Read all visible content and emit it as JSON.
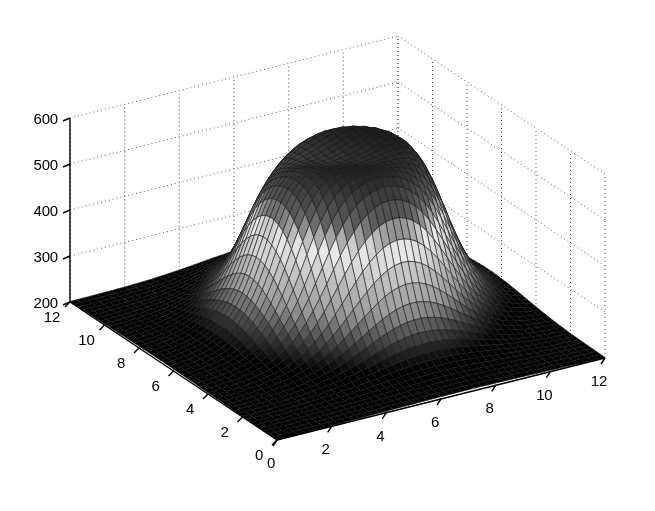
{
  "figure": {
    "width": 655,
    "height": 511,
    "background": "#ffffff",
    "title": "",
    "renderer": "surf-mesh-3d",
    "colormap": "gray"
  },
  "chart_data": {
    "type": "heatmap",
    "subtype": "surface-3d",
    "title": "",
    "xlabel": "",
    "ylabel": "",
    "zlabel": "",
    "grid": true,
    "legend": false,
    "colormap": "gray",
    "shading": "faceted",
    "mesh_line_color": "#1a1a1a",
    "xlim": [
      0,
      12
    ],
    "ylim": [
      0,
      12
    ],
    "zlim": [
      200,
      600
    ],
    "xticks": [
      0,
      2,
      4,
      6,
      8,
      10,
      12
    ],
    "yticks": [
      0,
      2,
      4,
      6,
      8,
      10,
      12
    ],
    "zticks": [
      200,
      300,
      400,
      500,
      600
    ],
    "xtick_labels": [
      "0",
      "2",
      "4",
      "6",
      "8",
      "10",
      "12"
    ],
    "ytick_labels": [
      "0",
      "2",
      "4",
      "6",
      "8",
      "10",
      "12"
    ],
    "ztick_labels": [
      "200",
      "300",
      "400",
      "500",
      "600"
    ],
    "view_azimuth": -37.5,
    "view_elevation": 30,
    "grid_lines": {
      "style": "dotted",
      "color": "#555555",
      "walls": [
        "back-left",
        "back-right",
        "floor"
      ]
    },
    "surface": {
      "description": "Plateau / mesa-shaped surface rising from a flat base of ~200 to a broad dark summit of ~570 near the centre, with light-grey mid-slopes and a shallow saddle notch on the front face.",
      "base_value": 200,
      "peak_value": 570,
      "peak_x": 6.8,
      "peak_y": 6.8,
      "nx": 49,
      "ny": 49,
      "model": {
        "flat_floor": 200,
        "plateau_amplitude": 372,
        "plateau_radius": 3.4,
        "plateau_sharpness": 3.0,
        "ridge_tilt_x": 0.35,
        "ridge_tilt_y": 0.18,
        "front_notch_depth": 34,
        "front_notch_width": 0.9
      }
    },
    "gray_levels": {
      "low": "#000000",
      "mid_low": "#4a4a4a",
      "mid": "#9a9a9a",
      "mid_high": "#d8d8d8",
      "high": "#000000"
    }
  },
  "axes": {
    "z_axis": {
      "name": "z-axis",
      "ticks": [
        {
          "label": "600",
          "value": 600
        },
        {
          "label": "500",
          "value": 500
        },
        {
          "label": "400",
          "value": 400
        },
        {
          "label": "300",
          "value": 300
        },
        {
          "label": "200",
          "value": 200
        }
      ]
    },
    "y_axis_left": {
      "name": "y-axis",
      "ticks": [
        {
          "label": "12",
          "value": 12
        },
        {
          "label": "10",
          "value": 10
        },
        {
          "label": "8",
          "value": 8
        },
        {
          "label": "6",
          "value": 6
        },
        {
          "label": "4",
          "value": 4
        },
        {
          "label": "2",
          "value": 2
        },
        {
          "label": "0",
          "value": 0
        }
      ]
    },
    "x_axis_right": {
      "name": "x-axis",
      "ticks": [
        {
          "label": "0",
          "value": 0
        },
        {
          "label": "2",
          "value": 2
        },
        {
          "label": "4",
          "value": 4
        },
        {
          "label": "6",
          "value": 6
        },
        {
          "label": "8",
          "value": 8
        },
        {
          "label": "10",
          "value": 10
        },
        {
          "label": "12",
          "value": 12
        }
      ]
    }
  }
}
